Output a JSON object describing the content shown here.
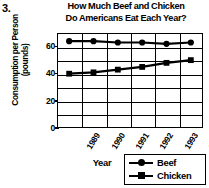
{
  "question_number": "3.",
  "chart_data": {
    "type": "line",
    "title": "How Much Beef and Chicken Do Americans Eat Each Year?",
    "title_lines": [
      "How Much Beef and Chicken",
      "Do Americans Eat Each Year?"
    ],
    "xlabel": "Year",
    "ylabel": "Consumption per Person (pounds)",
    "ylabel_lines": [
      "Consumption per Person",
      "(pounds)"
    ],
    "categories": [
      "1989",
      "1990",
      "1991",
      "1992",
      "1993",
      "1994"
    ],
    "ylim": [
      0,
      70
    ],
    "yticks": [
      0,
      20,
      40,
      60
    ],
    "ytick_labels": [
      "0",
      "20",
      "40",
      "60"
    ],
    "gridline_step": 10,
    "grid": true,
    "legend_position": "bottom-right",
    "series": [
      {
        "name": "Beef",
        "marker": "circle",
        "color": "#000000",
        "values": [
          64,
          64,
          63,
          63,
          62,
          63
        ]
      },
      {
        "name": "Chicken",
        "marker": "square",
        "color": "#000000",
        "values": [
          40,
          41,
          43,
          45,
          48,
          50
        ]
      }
    ]
  },
  "legend": {
    "items": [
      {
        "label": "Beef",
        "marker": "circle"
      },
      {
        "label": "Chicken",
        "marker": "square"
      }
    ]
  }
}
